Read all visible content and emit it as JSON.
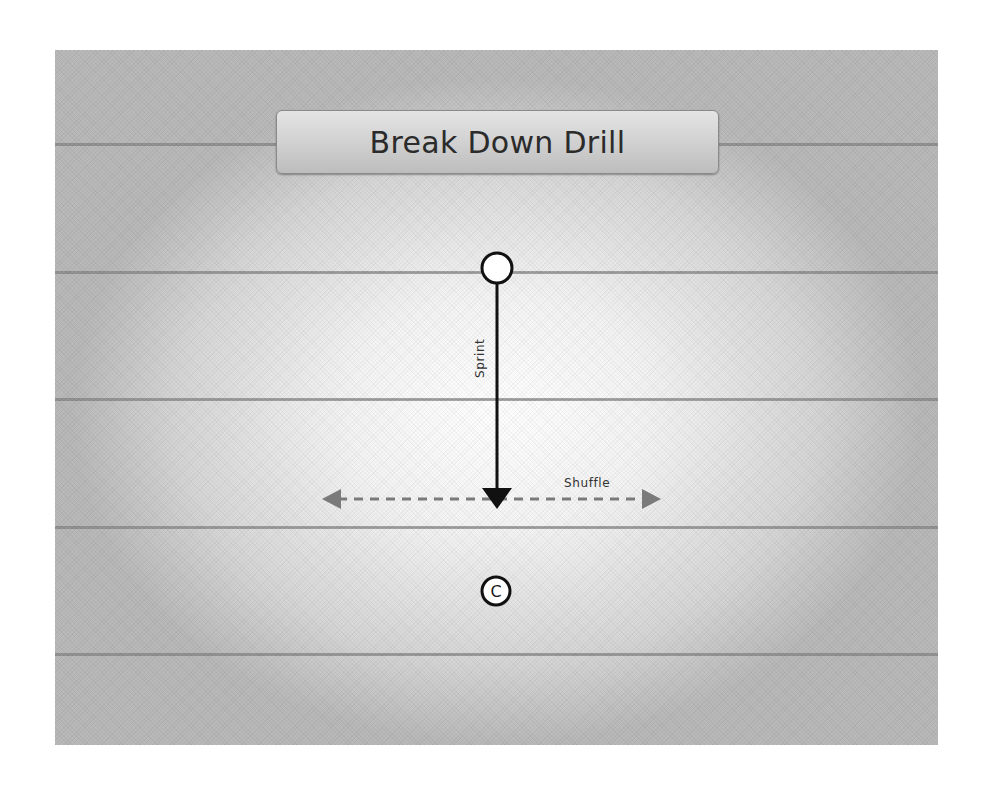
{
  "title": "Break Down Drill",
  "field": {
    "yard_lines_y": [
      143,
      271,
      398,
      526,
      653
    ],
    "colors": {
      "background_center": "#ffffff",
      "background_edge": "#b9b9b9",
      "yard_line": "#8c8c8c"
    }
  },
  "players": [
    {
      "id": "player",
      "label": "",
      "cx": 497,
      "cy": 268,
      "r": 15
    },
    {
      "id": "coach",
      "label": "C",
      "cx": 496,
      "cy": 591,
      "r": 14
    }
  ],
  "routes": [
    {
      "id": "sprint",
      "label": "Sprint",
      "style": "solid",
      "color": "#111111",
      "from": [
        497,
        284
      ],
      "to": [
        497,
        508
      ]
    },
    {
      "id": "shuffle",
      "label": "Shuffle",
      "style": "dashed",
      "color": "#7a7a7a",
      "from": [
        322,
        499
      ],
      "to": [
        661,
        499
      ],
      "direction": "both"
    }
  ]
}
